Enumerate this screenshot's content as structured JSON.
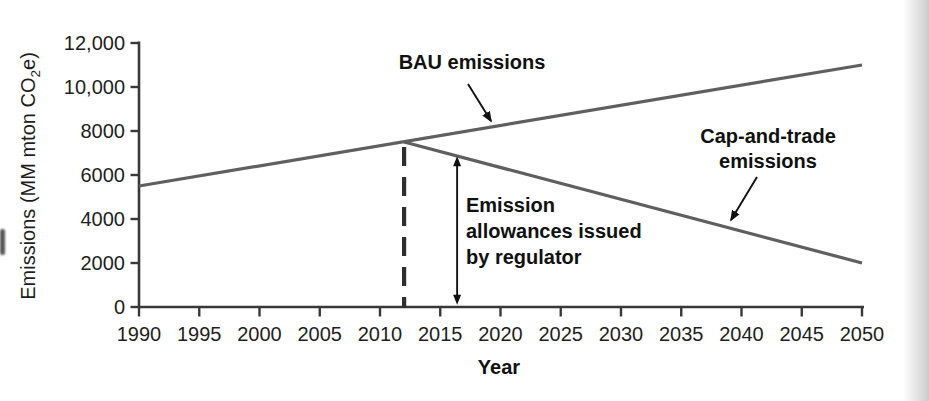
{
  "chart_data": {
    "type": "line",
    "title": "",
    "xlabel": "Year",
    "ylabel": "Emissions (MM mton CO2e)",
    "ylabel_parts": {
      "pre": "Emissions (MM mton CO",
      "sub": "2",
      "post": "e)"
    },
    "xlim": [
      1990,
      2050
    ],
    "ylim": [
      0,
      12000
    ],
    "grid": false,
    "legend": "none (direct line labels with arrows)",
    "x_ticks": [
      1990,
      1995,
      2000,
      2005,
      2010,
      2015,
      2020,
      2025,
      2030,
      2035,
      2040,
      2045,
      2050
    ],
    "y_ticks": [
      {
        "value": 0,
        "label": "0"
      },
      {
        "value": 2000,
        "label": "2000"
      },
      {
        "value": 4000,
        "label": "4000"
      },
      {
        "value": 6000,
        "label": "6000"
      },
      {
        "value": 8000,
        "label": "8000"
      },
      {
        "value": 10000,
        "label": "10,000"
      },
      {
        "value": 12000,
        "label": "12,000"
      }
    ],
    "series": [
      {
        "name": "BAU emissions",
        "color": "#5f5f5f",
        "points": [
          [
            1990,
            5500
          ],
          [
            2050,
            11000
          ]
        ]
      },
      {
        "name": "Cap-and-trade emissions",
        "color": "#5f5f5f",
        "points": [
          [
            2012,
            7500
          ],
          [
            2050,
            2000
          ]
        ]
      }
    ],
    "annotations": {
      "bau_label": {
        "text": "BAU emissions"
      },
      "cap_label": {
        "lines": [
          "Cap-and-trade",
          "emissions"
        ]
      },
      "allowance_label": {
        "lines": [
          "Emission",
          "allowances issued",
          "by regulator"
        ]
      },
      "dashed_line": {
        "x": 2012,
        "from_value": 0,
        "to_value": 7500
      },
      "double_arrow": {
        "x": 2016.4,
        "from_value": 100,
        "to_value": 6850
      }
    },
    "colors": {
      "axis": "#383838",
      "series_line": "#5f5f5f",
      "dashed_line": "#2e2e2e",
      "arrow": "#111111",
      "tick_text": "#1e1e1e",
      "annotation_text": "#111111"
    }
  }
}
